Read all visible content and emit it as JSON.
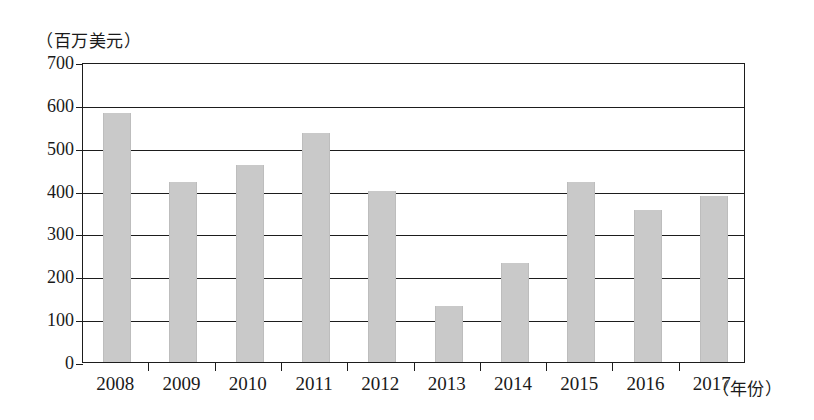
{
  "chart_data": {
    "type": "bar",
    "title": "",
    "subtitle": "",
    "xlabel": "（年份）",
    "ylabel": "（百万美元）",
    "categories": [
      "2008",
      "2009",
      "2010",
      "2011",
      "2012",
      "2013",
      "2014",
      "2015",
      "2016",
      "2017"
    ],
    "values": [
      580,
      420,
      460,
      535,
      400,
      130,
      232,
      420,
      355,
      388
    ],
    "ylim": [
      0,
      700
    ],
    "ytick_labels": [
      "700",
      "600",
      "500",
      "400",
      "300",
      "200",
      "100",
      "0"
    ],
    "ytick_values": [
      700,
      600,
      500,
      400,
      300,
      200,
      100,
      0
    ],
    "grid": true,
    "legend": "none",
    "bar_color": "#c9c9c9",
    "axis_color": "#1d1d1d",
    "background_color": "#ffffff"
  }
}
